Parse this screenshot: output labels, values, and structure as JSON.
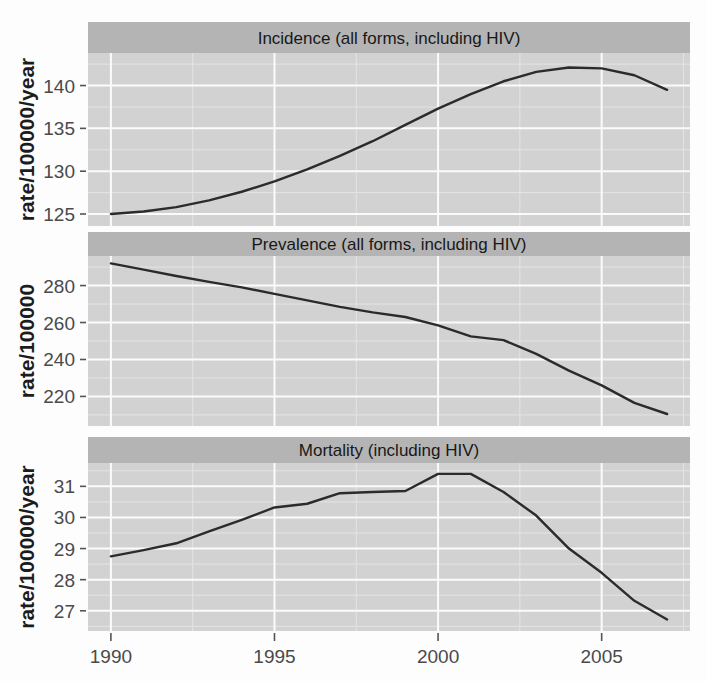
{
  "figure": {
    "background_color": "#fdfdfd",
    "panel_background_color": "#d2d2d2",
    "strip_background_color": "#b4b4b4",
    "gridline_color": "#fbfbfb",
    "line_color": "#2b2b2b",
    "x_axis_label": "",
    "x_tick_labels": [
      "1990",
      "1995",
      "2000",
      "2005"
    ],
    "x_tick_values": [
      1990,
      1995,
      2000,
      2005
    ],
    "panel_count": 3
  },
  "chart_data": [
    {
      "type": "line",
      "title": "Incidence (all forms, including HIV)",
      "xlabel": "",
      "ylabel": "rate/100000/year",
      "xlim": [
        1989.3,
        2007.7
      ],
      "ylim": [
        123.6,
        143.8
      ],
      "grid": true,
      "legend": "none",
      "x": [
        1990,
        1991,
        1992,
        1993,
        1994,
        1995,
        1996,
        1997,
        1998,
        1999,
        2000,
        2001,
        2002,
        2003,
        2004,
        2005,
        2006,
        2007
      ],
      "y_tick_labels": [
        "125",
        "130",
        "135",
        "140"
      ],
      "y_tick_values": [
        125,
        130,
        135,
        140
      ],
      "values": [
        125.0,
        125.3,
        125.8,
        126.6,
        127.6,
        128.8,
        130.2,
        131.8,
        133.5,
        135.4,
        137.3,
        139.0,
        140.5,
        141.6,
        142.1,
        142.0,
        141.2,
        139.5
      ]
    },
    {
      "type": "line",
      "title": "Prevalence (all forms, including HIV)",
      "xlabel": "",
      "ylabel": "rate/100000",
      "xlim": [
        1989.3,
        2007.7
      ],
      "ylim": [
        204.0,
        296.0
      ],
      "grid": true,
      "legend": "none",
      "x": [
        1990,
        1991,
        1992,
        1993,
        1994,
        1995,
        1996,
        1997,
        1998,
        1999,
        2000,
        2001,
        2002,
        2003,
        2004,
        2005,
        2006,
        2007
      ],
      "y_tick_labels": [
        "220",
        "240",
        "260",
        "280"
      ],
      "y_tick_values": [
        220,
        240,
        260,
        280
      ],
      "values": [
        292.0,
        288.6,
        285.2,
        282.0,
        279.0,
        275.5,
        272.0,
        268.5,
        265.5,
        263.0,
        258.5,
        252.5,
        250.5,
        243.0,
        234.0,
        226.0,
        216.5,
        210.5
      ]
    },
    {
      "type": "line",
      "title": "Mortality (including HIV)",
      "xlabel": "",
      "ylabel": "rate/100000/year",
      "xlim": [
        1989.3,
        2007.7
      ],
      "ylim": [
        26.35,
        31.75
      ],
      "grid": true,
      "legend": "none",
      "x": [
        1990,
        1991,
        1992,
        1993,
        1994,
        1995,
        1996,
        1997,
        1998,
        1999,
        2000,
        2001,
        2002,
        2003,
        2004,
        2005,
        2006,
        2007
      ],
      "y_tick_labels": [
        "27",
        "28",
        "29",
        "30",
        "31"
      ],
      "y_tick_values": [
        27,
        28,
        29,
        30,
        31
      ],
      "values": [
        28.75,
        28.95,
        29.17,
        29.55,
        29.92,
        30.32,
        30.44,
        30.78,
        30.82,
        30.85,
        31.4,
        31.4,
        30.82,
        30.06,
        29.0,
        28.22,
        27.32,
        26.72
      ]
    }
  ]
}
